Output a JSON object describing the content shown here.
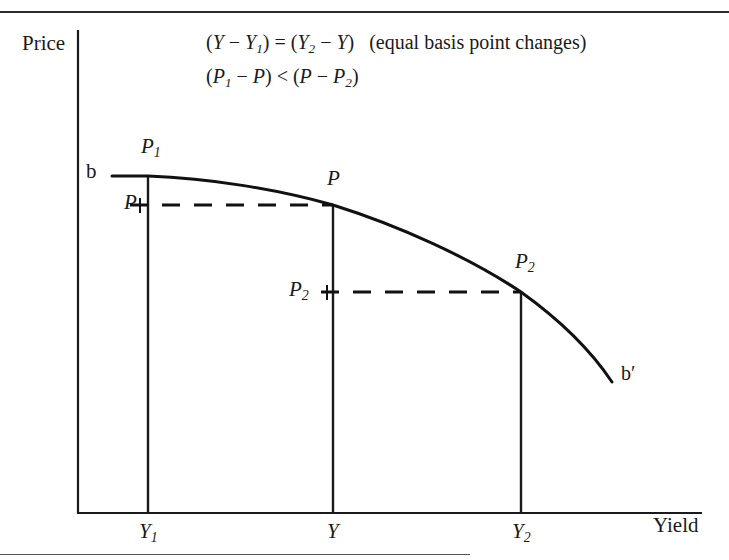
{
  "figure": {
    "kind": "price-yield-curve-diagram",
    "axes": {
      "y_axis_label": "Price",
      "x_axis_label": "Yield"
    },
    "annotations": {
      "equation_line_1_html": "(<i>Y</i> &#8722; <i>Y</i><sub>1</sub>) = (<i>Y</i><sub>2</sub> &#8722; <i>Y</i>)&nbsp;&nbsp; (equal basis point changes)",
      "equation_line_1_text": "(Y - Y1) = (Y2 - Y)  (equal basis point changes)",
      "equation_line_2_html": "(<i>P</i><sub>1</sub> &#8722; <i>P</i>) &lt; (<i>P</i> &#8722; <i>P</i><sub>2</sub>)",
      "equation_line_2_text": "(P1 - P) < (P - P2)",
      "note": "(equal basis point changes)"
    },
    "curve": {
      "start_label": "b",
      "end_label": "b′",
      "color": "#111111"
    },
    "price_labels": {
      "p1_on_curve": "P",
      "p1_on_curve_sub": "1",
      "p_on_axis": "P",
      "p_on_curve": "P",
      "p2_on_axis": "P",
      "p2_on_axis_sub": "2",
      "p2_on_curve": "P",
      "p2_on_curve_sub": "2"
    },
    "yield_ticks": [
      {
        "label": "Y",
        "sub": "1",
        "x": 148
      },
      {
        "label": "Y",
        "sub": "",
        "x": 333
      },
      {
        "label": "Y",
        "sub": "2",
        "x": 521
      }
    ]
  },
  "chart_data": {
    "type": "line",
    "title": "",
    "xlabel": "Yield",
    "ylabel": "Price",
    "grid": false,
    "legend": "none",
    "xlim": [
      0,
      1
    ],
    "ylim": [
      0,
      1
    ],
    "annotations": [
      "(Y - Y1) = (Y2 - Y)  (equal basis point changes)",
      "(P1 - P) < (P - P2)"
    ],
    "series": [
      {
        "name": "price-yield curve bb'",
        "start_label": "b",
        "end_label": "b'",
        "points_px": [
          [
            112,
            176
          ],
          [
            148,
            176
          ],
          [
            200,
            182
          ],
          [
            260,
            192
          ],
          [
            333,
            205
          ],
          [
            400,
            226
          ],
          [
            460,
            254
          ],
          [
            521,
            292
          ],
          [
            560,
            322
          ],
          [
            590,
            352
          ],
          [
            612,
            382
          ]
        ]
      }
    ],
    "marked_points": [
      {
        "name": "P1",
        "x_label": "Y1",
        "y_label": "P1",
        "px": [
          148,
          176
        ]
      },
      {
        "name": "P",
        "x_label": "Y",
        "y_label": "P",
        "px": [
          333,
          205
        ]
      },
      {
        "name": "P2",
        "x_label": "Y2",
        "y_label": "P2",
        "px": [
          521,
          292
        ]
      }
    ],
    "xticks": [
      "Y1",
      "Y",
      "Y2"
    ],
    "yticks": [
      "P1",
      "P",
      "P2"
    ]
  }
}
